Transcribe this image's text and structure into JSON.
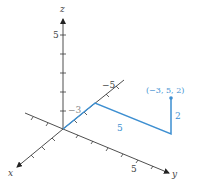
{
  "diagram": {
    "type": "3d-coordinate-system",
    "axes": {
      "x": {
        "label": "x"
      },
      "y": {
        "label": "y",
        "tick_label": "5"
      },
      "z": {
        "label": "z",
        "tick_label": "5"
      },
      "neg_x": {
        "tick_labels": [
          "−3",
          "−5"
        ]
      }
    },
    "path": {
      "color": "#3d8fd1",
      "segments": [
        {
          "from": [
            0,
            0,
            0
          ],
          "to": [
            -3,
            0,
            0
          ],
          "label": "−3"
        },
        {
          "from": [
            -3,
            0,
            0
          ],
          "to": [
            -3,
            5,
            0
          ],
          "label": "5"
        },
        {
          "from": [
            -3,
            5,
            0
          ],
          "to": [
            -3,
            5,
            2
          ],
          "label": "2"
        }
      ]
    },
    "point": {
      "coords": [
        -3,
        5,
        2
      ],
      "label": "(−3, 5, 2)"
    }
  }
}
